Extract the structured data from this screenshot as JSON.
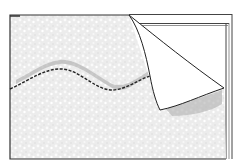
{
  "figure": {
    "colors": {
      "background": "#ffffff",
      "texture": "#ebebeb",
      "texture_speckle": "#ffffff",
      "outline": "#333333",
      "damp_patch": "#a8a8a8",
      "flap": "#ffffff"
    },
    "elements": [
      "textured-sheet",
      "wavy-dashed-seam",
      "peeled-corner-flap",
      "exposed-wall-frame"
    ]
  }
}
